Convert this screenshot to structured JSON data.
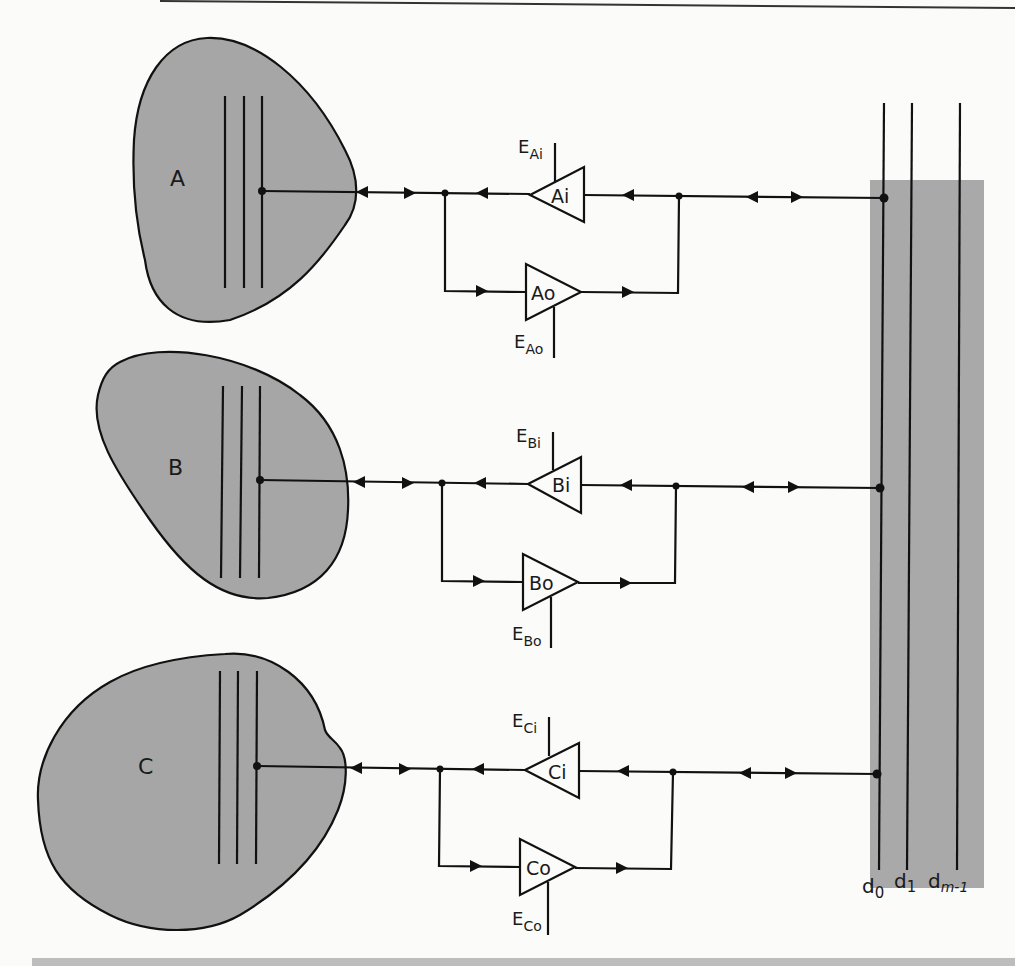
{
  "diagram": {
    "colors": {
      "device_fill": "#a6a6a6",
      "bus_panel_fill": "#a9a9a9",
      "line": "#111111",
      "background": "#fbfbfa",
      "caption_bar": "#bdbdbd"
    },
    "devices": [
      {
        "id": "A",
        "label": "A",
        "buffers": [
          {
            "label": "Ai",
            "enable_main": "E",
            "enable_sub": "Ai",
            "direction": "in"
          },
          {
            "label": "Ao",
            "enable_main": "E",
            "enable_sub": "Ao",
            "direction": "out"
          }
        ]
      },
      {
        "id": "B",
        "label": "B",
        "buffers": [
          {
            "label": "Bi",
            "enable_main": "E",
            "enable_sub": "Bi",
            "direction": "in"
          },
          {
            "label": "Bo",
            "enable_main": "E",
            "enable_sub": "Bo",
            "direction": "out"
          }
        ]
      },
      {
        "id": "C",
        "label": "C",
        "buffers": [
          {
            "label": "Ci",
            "enable_main": "E",
            "enable_sub": "Ci",
            "direction": "in"
          },
          {
            "label": "Co",
            "enable_main": "E",
            "enable_sub": "Co",
            "direction": "out"
          }
        ]
      }
    ],
    "bus_lines": [
      {
        "main": "d",
        "sub": "0"
      },
      {
        "main": "d",
        "sub": "1"
      },
      {
        "main": "d",
        "sub": "m-1"
      }
    ]
  }
}
